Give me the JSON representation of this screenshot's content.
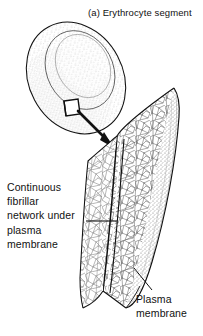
{
  "figure": {
    "title": "(a) Erythrocyte segment",
    "labels": {
      "network": "Continuous\nfibrillar\nnetwork under\nplasma\nmembrane",
      "membrane": "Plasma\nmembrane"
    },
    "colors": {
      "ink": "#111111",
      "background": "#ffffff",
      "stipple": "#6d6d6d",
      "mesh": "#8a8a8a"
    },
    "parts": {
      "erythrocyte": "biconcave-disc",
      "callout_box": "magnification-square",
      "arrow": "magnification-arrow",
      "segment": "membrane-segment-cutaway"
    }
  }
}
